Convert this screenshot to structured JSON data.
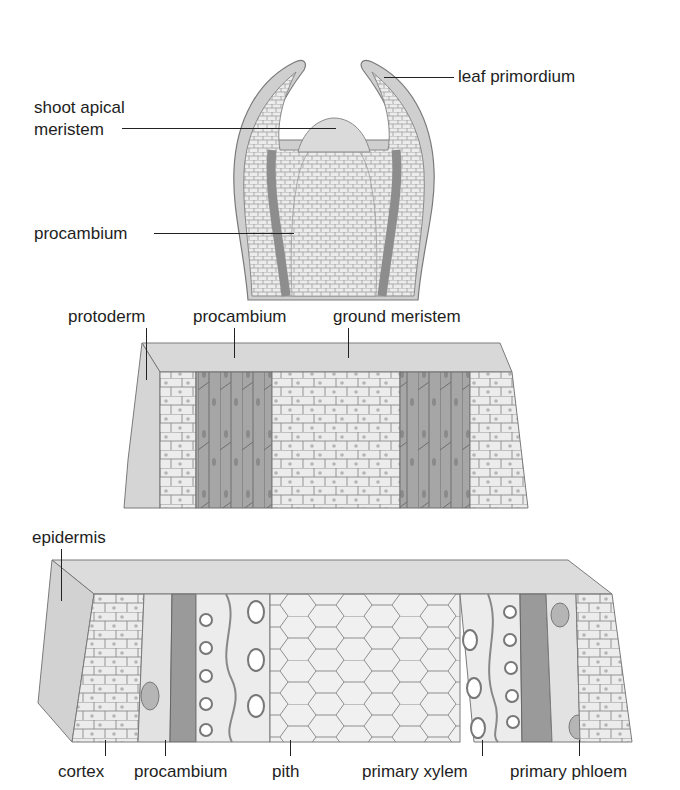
{
  "figure": {
    "panels": [
      {
        "id": "shoot-tip",
        "description": "longitudinal section of shoot tip",
        "labels": [
          {
            "text": "leaf primordium"
          },
          {
            "text": "shoot apical\nmeristem",
            "line1": "shoot apical",
            "line2": "meristem"
          },
          {
            "text": "procambium"
          }
        ]
      },
      {
        "id": "primary-meristems-block",
        "description": "3D block showing primary meristems",
        "labels": [
          {
            "text": "protoderm"
          },
          {
            "text": "procambium"
          },
          {
            "text": "ground meristem"
          }
        ]
      },
      {
        "id": "primary-tissues-block",
        "description": "3D block showing differentiated primary tissues",
        "labels": [
          {
            "text": "epidermis"
          },
          {
            "text": "cortex"
          },
          {
            "text": "procambium"
          },
          {
            "text": "pith"
          },
          {
            "text": "primary xylem"
          },
          {
            "text": "primary phloem"
          }
        ]
      }
    ],
    "colors": {
      "tissue_light": "#e6e6e6",
      "tissue_mid": "#cfcfcf",
      "tissue_dark": "#a9a9a9",
      "outline": "#7a7a7a",
      "leader": "#222222"
    }
  }
}
